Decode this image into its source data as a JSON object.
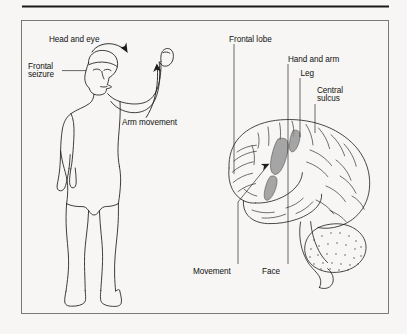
{
  "figure": {
    "type": "medical-anatomical-line-diagram",
    "background_color": "#f7f6f4",
    "ink_color": "#1c1c1c",
    "shade_color": "#8e8e8e",
    "frame": {
      "visible": true,
      "color": "#6d6d6d"
    },
    "top_rule": {
      "visible": true,
      "color": "#1a1a1a"
    }
  },
  "left_panel": {
    "name": "patient-figure",
    "description": "Standing human figure with right arm raised and head turned",
    "labels": {
      "head_and_eye": "Head and eye",
      "frontal_seizure_line1": "Frontal",
      "frontal_seizure_line2": "seizure",
      "arm_movement": "Arm movement"
    }
  },
  "right_panel": {
    "name": "brain-lateral-view",
    "description": "Lateral view of cerebral hemisphere with shaded motor strip regions, temporal lobe, cerebellum and brainstem",
    "labels": {
      "frontal_lobe": "Frontal lobe",
      "hand_and_arm": "Hand and arm",
      "leg": "Leg",
      "central_sulcus_line1": "Central",
      "central_sulcus_line2": "sulcus",
      "movement": "Movement",
      "face": "Face"
    },
    "shaded_regions": [
      {
        "name": "leg-area",
        "label_ref": "leg"
      },
      {
        "name": "hand-and-arm-area",
        "label_ref": "hand_and_arm"
      },
      {
        "name": "face-area",
        "label_ref": "face"
      }
    ]
  }
}
